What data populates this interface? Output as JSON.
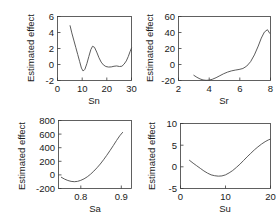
{
  "figure": {
    "title": "",
    "panel_count": 4
  },
  "chart_data": [
    {
      "type": "line",
      "panel": "top-left",
      "title": "",
      "xlabel": "Sn",
      "ylabel": "Estimated effect",
      "xlim": [
        0,
        30
      ],
      "ylim": [
        -2,
        6
      ],
      "xticks": [
        0,
        10,
        20,
        30
      ],
      "xticklabels": [
        "0",
        "10",
        "20",
        "30"
      ],
      "yticks": [
        -2,
        0,
        2,
        4,
        6
      ],
      "yticklabels": [
        "-2",
        "0",
        "2",
        "4",
        "6"
      ],
      "grid": false,
      "legend": null,
      "x": [
        5.1,
        5.8,
        6.6,
        7.4,
        8.2,
        9.0,
        9.7,
        10.4,
        11.1,
        11.9,
        12.7,
        13.5,
        14.2,
        15.0,
        15.9,
        16.8,
        17.7,
        18.6,
        19.6,
        20.7,
        21.8,
        22.9,
        24.0,
        25.1,
        26.1,
        27.0,
        27.9,
        28.7,
        29.4,
        30.0
      ],
      "y": [
        4.85,
        3.95,
        3.05,
        2.15,
        1.25,
        0.35,
        -0.45,
        -0.82,
        -0.6,
        0.1,
        1.0,
        1.85,
        2.28,
        2.15,
        1.55,
        0.85,
        0.3,
        -0.05,
        -0.25,
        -0.32,
        -0.3,
        -0.22,
        -0.18,
        -0.25,
        -0.22,
        0.05,
        0.45,
        1.0,
        1.6,
        2.05
      ]
    },
    {
      "type": "line",
      "panel": "top-right",
      "title": "",
      "xlabel": "Sr",
      "ylabel": "Estimated effect",
      "xlim": [
        2,
        8
      ],
      "ylim": [
        -20,
        60
      ],
      "xticks": [
        2,
        4,
        6,
        8
      ],
      "xticklabels": [
        "2",
        "4",
        "6",
        "8"
      ],
      "yticks": [
        -20,
        0,
        20,
        40,
        60
      ],
      "yticklabels": [
        "-20",
        "0",
        "20",
        "40",
        "60"
      ],
      "grid": false,
      "legend": null,
      "x": [
        3.0,
        3.2,
        3.4,
        3.6,
        3.8,
        4.0,
        4.2,
        4.45,
        4.7,
        4.95,
        5.2,
        5.45,
        5.7,
        5.95,
        6.2,
        6.45,
        6.7,
        6.95,
        7.2,
        7.4,
        7.6,
        7.8,
        7.95
      ],
      "y": [
        -13.5,
        -16.0,
        -18.0,
        -19.3,
        -19.8,
        -19.5,
        -18.5,
        -16.5,
        -14.0,
        -11.5,
        -9.5,
        -8.0,
        -7.0,
        -6.2,
        -5.0,
        -2.0,
        3.5,
        12.0,
        23.0,
        33.0,
        40.5,
        43.5,
        39.0
      ]
    },
    {
      "type": "line",
      "panel": "bottom-left",
      "title": "",
      "xlabel": "Sa",
      "ylabel": "Estimated effect",
      "xlim": [
        0.745,
        0.925
      ],
      "ylim": [
        -200,
        800
      ],
      "xticks": [
        0.8,
        0.9
      ],
      "xticklabels": [
        "0.8",
        "0.9"
      ],
      "yticks": [
        -200,
        0,
        200,
        400,
        600,
        800
      ],
      "yticklabels": [
        "-200",
        "0",
        "200",
        "400",
        "600",
        "800"
      ],
      "grid": false,
      "legend": null,
      "x": [
        0.752,
        0.76,
        0.768,
        0.776,
        0.784,
        0.792,
        0.8,
        0.808,
        0.816,
        0.824,
        0.832,
        0.84,
        0.848,
        0.856,
        0.864,
        0.872,
        0.88,
        0.888,
        0.896,
        0.903
      ],
      "y": [
        -35,
        -62,
        -82,
        -95,
        -100,
        -95,
        -80,
        -58,
        -28,
        10,
        55,
        105,
        160,
        222,
        288,
        358,
        430,
        505,
        575,
        625
      ]
    },
    {
      "type": "line",
      "panel": "bottom-right",
      "title": "",
      "xlabel": "Su",
      "ylabel": "Estimated effect",
      "xlim": [
        0,
        20
      ],
      "ylim": [
        -5,
        10
      ],
      "xticks": [
        0,
        10,
        20
      ],
      "xticklabels": [
        "0",
        "10",
        "20"
      ],
      "yticks": [
        -5,
        0,
        5,
        10
      ],
      "yticklabels": [
        "-5",
        "0",
        "5",
        "10"
      ],
      "grid": false,
      "legend": null,
      "x": [
        2.0,
        2.8,
        3.6,
        4.4,
        5.2,
        6.0,
        6.8,
        7.6,
        8.4,
        9.2,
        10.0,
        10.8,
        11.6,
        12.4,
        13.2,
        14.0,
        14.8,
        15.6,
        16.4,
        17.2,
        18.0,
        18.8,
        19.5,
        20.0
      ],
      "y": [
        1.5,
        0.85,
        0.25,
        -0.35,
        -0.95,
        -1.45,
        -1.85,
        -2.05,
        -2.15,
        -2.1,
        -1.85,
        -1.4,
        -0.85,
        -0.15,
        0.6,
        1.45,
        2.3,
        3.1,
        3.9,
        4.6,
        5.25,
        5.8,
        6.2,
        6.4
      ]
    }
  ]
}
